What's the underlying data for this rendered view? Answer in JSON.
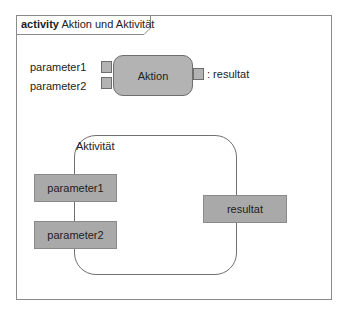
{
  "frame": {
    "keyword": "activity",
    "name": "Aktion und Aktivität"
  },
  "action": {
    "name": "Aktion",
    "input_pins": [
      "parameter1",
      "parameter2"
    ],
    "output_pin": ": resultat"
  },
  "activity": {
    "name": "Aktivität",
    "parameter_nodes": [
      "parameter1",
      "parameter2"
    ],
    "result_node": "resultat"
  },
  "colors": {
    "node_fill": "#b3b3b3",
    "parameter_fill": "#a9a9a9",
    "stroke": "#707070"
  }
}
